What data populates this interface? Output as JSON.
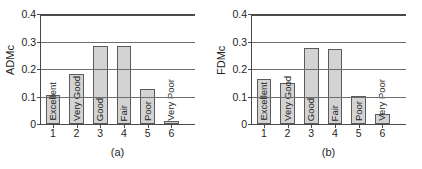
{
  "figure": {
    "panels": [
      {
        "id": "a",
        "caption": "(a)",
        "ylabel": "ADMc",
        "chart_data": {
          "type": "bar",
          "title": "",
          "xlabel": "",
          "ylabel": "ADMc",
          "categories": [
            "1",
            "2",
            "3",
            "4",
            "5",
            "6"
          ],
          "bar_labels": [
            "Excellent",
            "Very Good",
            "Good",
            "Fair",
            "Poor",
            "Very Poor"
          ],
          "values": [
            0.105,
            0.183,
            0.285,
            0.285,
            0.128,
            0.012
          ],
          "ylim": [
            0,
            0.4
          ],
          "yticks": [
            "0",
            "0.1",
            "0.2",
            "0.3",
            "0.4"
          ],
          "ytick_values": [
            0,
            0.1,
            0.2,
            0.3,
            0.4
          ],
          "xlim": [
            0.5,
            7.0
          ],
          "grid": "horizontal",
          "legend": "none",
          "bar_facecolor": "#d3d3d3",
          "bar_edgecolor": "#5b5b5b"
        }
      },
      {
        "id": "b",
        "caption": "(b)",
        "ylabel": "FDMc",
        "chart_data": {
          "type": "bar",
          "title": "",
          "xlabel": "",
          "ylabel": "FDMc",
          "categories": [
            "1",
            "2",
            "3",
            "4",
            "5",
            "6"
          ],
          "bar_labels": [
            "Excellent",
            "Very Good",
            "Good",
            "Fair",
            "Poor",
            "Very Poor"
          ],
          "values": [
            0.165,
            0.148,
            0.278,
            0.272,
            0.102,
            0.037
          ],
          "ylim": [
            0,
            0.4
          ],
          "yticks": [
            "0",
            "0.1",
            "0.2",
            "0.3",
            "0.4"
          ],
          "ytick_values": [
            0,
            0.1,
            0.2,
            0.3,
            0.4
          ],
          "xlim": [
            0.5,
            7.0
          ],
          "grid": "horizontal",
          "legend": "none",
          "bar_facecolor": "#d3d3d3",
          "bar_edgecolor": "#5b5b5b"
        }
      }
    ]
  }
}
